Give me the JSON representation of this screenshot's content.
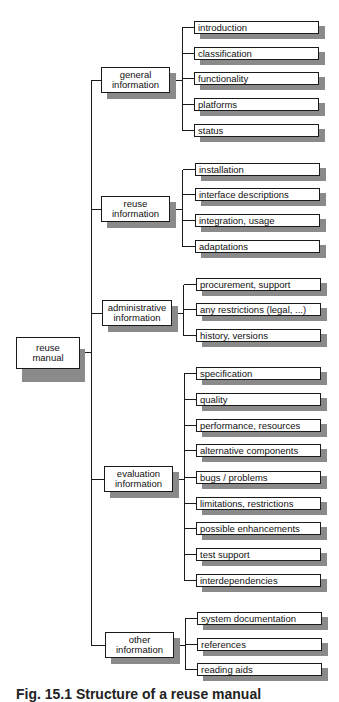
{
  "diagram": {
    "type": "tree",
    "root": {
      "label_line1": "reuse",
      "label_line2": "manual"
    },
    "groups": [
      {
        "label_line1": "general",
        "label_line2": "information",
        "items": [
          "introduction",
          "classification",
          "functionality",
          "platforms",
          "status"
        ]
      },
      {
        "label_line1": "reuse",
        "label_line2": "information",
        "items": [
          "installation",
          "interface descriptions",
          "integration, usage",
          "adaptations"
        ]
      },
      {
        "label_line1": "administrative",
        "label_line2": "information",
        "items": [
          "procurement, support",
          "any restrictions (legal, ...)",
          "history, versions"
        ]
      },
      {
        "label_line1": "evaluation",
        "label_line2": "information",
        "items": [
          "specification",
          "quality",
          "performance, resources",
          "alternative components",
          "bugs / problems",
          "limitations, restrictions",
          "possible enhancements",
          "test support",
          "interdependencies"
        ]
      },
      {
        "label_line1": "other",
        "label_line2": "information",
        "items": [
          "system documentation",
          "references",
          "reading aids"
        ]
      }
    ]
  },
  "caption": "Fig. 15.1 Structure of a reuse manual"
}
